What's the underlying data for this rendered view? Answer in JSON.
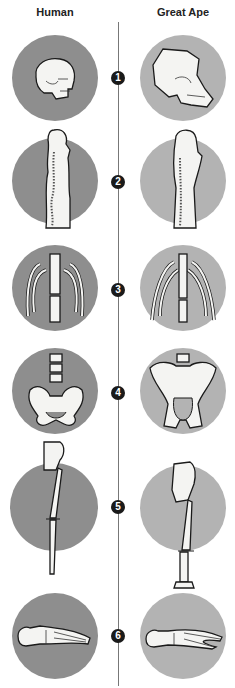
{
  "headers": {
    "left": "Human",
    "right": "Great Ape"
  },
  "colors": {
    "human_circle": "#8e8e8e",
    "ape_circle": "#b3b3b3",
    "badge": "#1a1a1a",
    "divider": "#777777"
  },
  "rows": [
    {
      "number": "1",
      "feature": "skull"
    },
    {
      "number": "2",
      "feature": "spine"
    },
    {
      "number": "3",
      "feature": "rib-cage"
    },
    {
      "number": "4",
      "feature": "pelvis"
    },
    {
      "number": "5",
      "feature": "leg"
    },
    {
      "number": "6",
      "feature": "foot"
    }
  ]
}
